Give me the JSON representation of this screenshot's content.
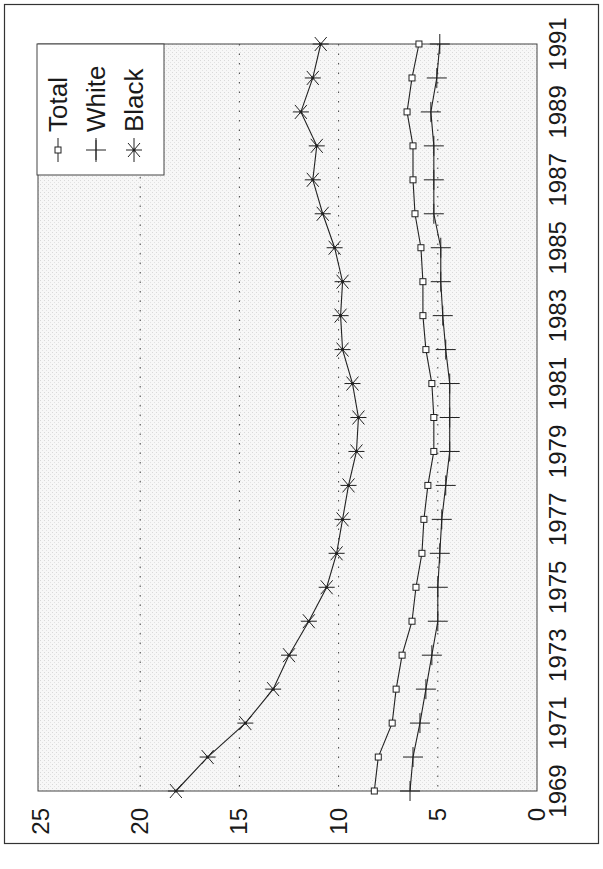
{
  "chart_data": {
    "type": "line",
    "orientation": "rotated-90-clockwise",
    "title": "",
    "xlabel": "",
    "ylabel": "",
    "x": [
      1969,
      1970,
      1971,
      1972,
      1973,
      1974,
      1975,
      1976,
      1977,
      1978,
      1979,
      1980,
      1981,
      1982,
      1983,
      1984,
      1985,
      1986,
      1987,
      1988,
      1989,
      1990,
      1991
    ],
    "x_tick_labels": [
      "1969",
      "1971",
      "1973",
      "1975",
      "1977",
      "1979",
      "1981",
      "1983",
      "1985",
      "1987",
      "1989",
      "1991"
    ],
    "y_tick_labels": [
      "0",
      "5",
      "10",
      "15",
      "20",
      "25"
    ],
    "ylim": [
      0,
      25
    ],
    "xlim": [
      1969,
      1991
    ],
    "grid": {
      "y_major": [
        5,
        10,
        15,
        20
      ],
      "style": "dotted"
    },
    "legend": {
      "position": "top-left (rotated view)",
      "entries": [
        "Total",
        "White",
        "Black"
      ]
    },
    "series": [
      {
        "name": "Total",
        "marker": "square",
        "values": [
          8.2,
          8.0,
          7.3,
          7.1,
          6.8,
          6.3,
          6.1,
          5.8,
          5.7,
          5.5,
          5.2,
          5.2,
          5.3,
          5.6,
          5.75,
          5.75,
          5.85,
          6.15,
          6.25,
          6.25,
          6.55,
          6.3,
          5.95
        ]
      },
      {
        "name": "White",
        "marker": "plus",
        "values": [
          6.4,
          6.25,
          5.9,
          5.6,
          5.3,
          5.0,
          5.0,
          4.9,
          4.8,
          4.6,
          4.4,
          4.4,
          4.4,
          4.6,
          4.75,
          4.85,
          4.85,
          5.2,
          5.2,
          5.2,
          5.35,
          5.05,
          4.9
        ]
      },
      {
        "name": "Black",
        "marker": "asterisk",
        "values": [
          18.2,
          16.6,
          14.7,
          13.3,
          12.5,
          11.5,
          10.6,
          10.1,
          9.8,
          9.5,
          9.1,
          9.0,
          9.3,
          9.8,
          9.9,
          9.8,
          10.2,
          10.8,
          11.3,
          11.1,
          11.9,
          11.3,
          10.9
        ]
      }
    ]
  },
  "legend": {
    "items": [
      {
        "label": "Total"
      },
      {
        "label": "White"
      },
      {
        "label": "Black"
      }
    ]
  },
  "colors": {
    "line": "#222222",
    "frame": "#333333",
    "plot_background": "#f4f4f4",
    "grid": "#444444"
  }
}
